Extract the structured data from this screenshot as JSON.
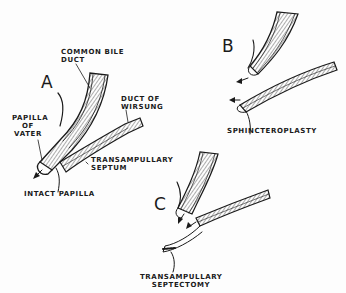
{
  "figure": {
    "panels": [
      {
        "id": "A",
        "letter": "A",
        "labels": {
          "common_bile_duct_1": "COMMON BILE",
          "common_bile_duct_2": "DUCT",
          "duct_of_wirsung_1": "DUCT OF",
          "duct_of_wirsung_2": "WIRSUNG",
          "papilla_1": "PAPILLA",
          "papilla_2": "OF",
          "papilla_3": "VATER",
          "septum_1": "TRANSAMPULLARY",
          "septum_2": "SEPTUM",
          "intact": "INTACT PAPILLA"
        }
      },
      {
        "id": "B",
        "letter": "B",
        "labels": {
          "procedure": "SPHINCTEROPLASTY"
        }
      },
      {
        "id": "C",
        "letter": "C",
        "labels": {
          "procedure_1": "TRANSAMPULLARY",
          "procedure_2": "SEPTECTOMY"
        }
      }
    ],
    "colors": {
      "ink": "#1a1a1a",
      "background": "#fdfdfd"
    }
  }
}
